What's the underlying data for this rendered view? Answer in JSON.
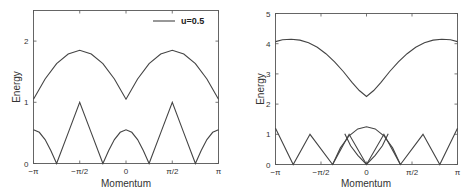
{
  "chart_data": [
    {
      "type": "line",
      "panel": "left",
      "title": "",
      "xlabel": "Momentum",
      "ylabel": "Energy",
      "xlim": [
        -3.14159,
        3.14159
      ],
      "ylim": [
        0,
        2.5
      ],
      "xticks": [
        {
          "value": -3.14159,
          "label": "−π"
        },
        {
          "value": -1.5708,
          "label": "−π/2"
        },
        {
          "value": 0,
          "label": "0"
        },
        {
          "value": 1.5708,
          "label": "π/2"
        },
        {
          "value": 3.14159,
          "label": "π"
        }
      ],
      "yticks": [
        {
          "value": 0,
          "label": "0"
        },
        {
          "value": 1,
          "label": "1"
        },
        {
          "value": 2,
          "label": "2"
        }
      ],
      "legend": [
        {
          "label": "u=0.5",
          "position": "upper right"
        }
      ],
      "grid": false,
      "series": [
        {
          "name": "upper band",
          "x": [
            -3.1416,
            -2.7489,
            -2.3562,
            -1.9635,
            -1.5708,
            -1.1781,
            -0.7854,
            -0.3927,
            0,
            0.3927,
            0.7854,
            1.1781,
            1.5708,
            1.9635,
            2.3562,
            2.7489,
            3.1416
          ],
          "y": [
            1.05,
            1.38,
            1.63,
            1.79,
            1.85,
            1.79,
            1.63,
            1.38,
            1.05,
            1.38,
            1.63,
            1.79,
            1.85,
            1.79,
            1.63,
            1.38,
            1.05
          ]
        },
        {
          "name": "lower band",
          "x": [
            -3.1416,
            -2.9452,
            -2.7489,
            -2.5525,
            -2.3562,
            -1.9635,
            -1.5708,
            -1.1781,
            -0.7854,
            -0.589,
            -0.3927,
            -0.1963,
            0,
            0.1963,
            0.3927,
            0.589,
            0.7854,
            1.1781,
            1.5708,
            1.9635,
            2.3562,
            2.5525,
            2.7489,
            2.9452,
            3.1416
          ],
          "y": [
            0.55,
            0.51,
            0.39,
            0.21,
            0.0,
            0.5,
            1.0,
            0.5,
            0.0,
            0.21,
            0.39,
            0.51,
            0.55,
            0.51,
            0.39,
            0.21,
            0.0,
            0.5,
            1.0,
            0.5,
            0.0,
            0.21,
            0.39,
            0.51,
            0.55
          ]
        }
      ]
    },
    {
      "type": "line",
      "panel": "right",
      "title": "",
      "xlabel": "Momentum",
      "ylabel": "Energy",
      "xlim": [
        -3.14159,
        3.14159
      ],
      "ylim": [
        0,
        5
      ],
      "xticks": [
        {
          "value": -3.14159,
          "label": "−π"
        },
        {
          "value": -1.5708,
          "label": "−π/2"
        },
        {
          "value": 0,
          "label": "0"
        },
        {
          "value": 1.5708,
          "label": "π/2"
        },
        {
          "value": 3.14159,
          "label": "π"
        }
      ],
      "yticks": [
        {
          "value": 0,
          "label": "0"
        },
        {
          "value": 1,
          "label": "1"
        },
        {
          "value": 2,
          "label": "2"
        },
        {
          "value": 3,
          "label": "3"
        },
        {
          "value": 4,
          "label": "4"
        },
        {
          "value": 5,
          "label": "5"
        }
      ],
      "legend": [],
      "grid": false,
      "series": [
        {
          "name": "upper band",
          "x": [
            -3.1416,
            -2.9,
            -2.6,
            -2.3,
            -2.0,
            -1.7,
            -1.4,
            -1.1,
            -0.8,
            -0.5,
            -0.25,
            0,
            0.25,
            0.5,
            0.8,
            1.1,
            1.4,
            1.7,
            2.0,
            2.3,
            2.6,
            2.9,
            3.1416
          ],
          "y": [
            4.07,
            4.13,
            4.15,
            4.12,
            4.03,
            3.88,
            3.67,
            3.4,
            3.08,
            2.72,
            2.45,
            2.25,
            2.45,
            2.72,
            3.08,
            3.4,
            3.67,
            3.88,
            4.03,
            4.12,
            4.15,
            4.13,
            4.07
          ]
        },
        {
          "name": "lower band (outer)",
          "x": [
            -3.1416,
            -2.53,
            -1.95,
            -1.17,
            -0.6,
            0,
            0.6,
            1.17,
            1.95,
            2.53,
            3.1416
          ],
          "y": [
            1.2,
            0.0,
            1.0,
            0.0,
            1.0,
            0.0,
            1.0,
            0.0,
            1.0,
            0.0,
            1.2
          ]
        },
        {
          "name": "lower band (central dome)",
          "x": [
            -1.17,
            -0.9,
            -0.6,
            -0.3,
            0,
            0.3,
            0.6,
            0.9,
            1.17
          ],
          "y": [
            0.0,
            0.55,
            0.95,
            1.18,
            1.25,
            1.18,
            0.95,
            0.55,
            0.0
          ]
        },
        {
          "name": "lower band (inner branches)",
          "x": [
            -0.75,
            -0.55,
            -0.3,
            0,
            0.3,
            0.55,
            0.75
          ],
          "y": [
            1.02,
            0.62,
            0.3,
            0.0,
            0.3,
            0.62,
            1.02
          ]
        }
      ]
    }
  ],
  "panels": {
    "left": {
      "ylabel": "Energy",
      "xlabel": "Momentum",
      "legend_label": "u=0.5"
    },
    "right": {
      "ylabel": "Energy",
      "xlabel": "Momentum"
    }
  }
}
